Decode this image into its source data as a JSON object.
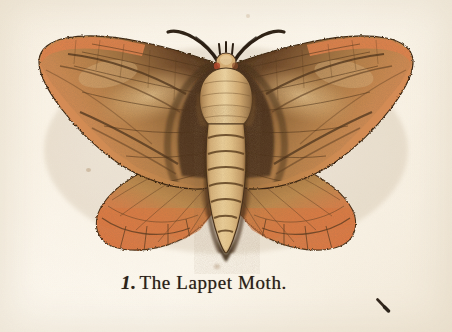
{
  "plate": {
    "caption_number": "1.",
    "caption_text": "The Lappet Moth.",
    "full_caption": "1. The Lappet Moth.",
    "subject": "lappet-moth-specimen",
    "style": "hand-coloured antique engraving",
    "background_color": "#fbf5ea"
  },
  "colors": {
    "paper": "#fbf5ea",
    "paper_shadow": "#f2e9d9",
    "wing_orange": "#d9763f",
    "wing_orange_light": "#e8915c",
    "wing_salmon": "#e08a57",
    "wing_brown": "#7a5130",
    "wing_dark_brown": "#4d331c",
    "wing_tan": "#c79a63",
    "wing_buff": "#e3c089",
    "body_buff": "#e6c68c",
    "body_tan": "#cba068",
    "ink_black": "#31231a",
    "caption_ink": "#2b2016"
  },
  "figure": {
    "name": "lappet-moth",
    "wingspan_px": 375,
    "body_parts": [
      {
        "name": "left-forewing",
        "label": "Left forewing"
      },
      {
        "name": "right-forewing",
        "label": "Right forewing"
      },
      {
        "name": "left-hindwing",
        "label": "Left hindwing"
      },
      {
        "name": "right-hindwing",
        "label": "Right hindwing"
      },
      {
        "name": "thorax",
        "label": "Thorax"
      },
      {
        "name": "abdomen",
        "label": "Abdomen"
      },
      {
        "name": "head",
        "label": "Head"
      },
      {
        "name": "left-antenna",
        "label": "Left antenna"
      },
      {
        "name": "right-antenna",
        "label": "Right antenna"
      }
    ],
    "abdomen_segments": 8
  },
  "marks": {
    "ink_stroke": "stray-ink-stroke",
    "foxing_spots": 3
  }
}
